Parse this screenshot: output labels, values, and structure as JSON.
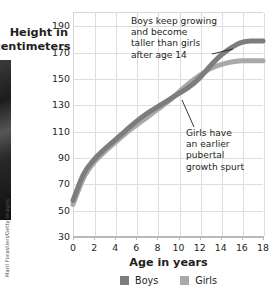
{
  "figure": {
    "photo_credit": "Maril Forastieri/Getty Images"
  },
  "legend": {
    "items": [
      {
        "label": "Boys",
        "color": "#7d7d7d"
      },
      {
        "label": "Girls",
        "color": "#a9a9a9"
      }
    ]
  },
  "annotations": {
    "boys": "Boys keep growing\nand become\ntaller than girls\nafter age 14",
    "girls": "Girls have\nan earlier\npubertal\ngrowth spurt"
  },
  "chart_data": {
    "type": "line",
    "title": "",
    "xlabel": "Age in years",
    "ylabel": "Height in centimeters",
    "xlim": [
      0,
      18
    ],
    "ylim": [
      30,
      200
    ],
    "xticks": [
      0,
      2,
      4,
      6,
      8,
      10,
      12,
      14,
      16,
      18
    ],
    "yticks": [
      30,
      50,
      70,
      90,
      110,
      130,
      150,
      170,
      190
    ],
    "xticklabels": [
      "0",
      "2",
      "4",
      "6",
      "8",
      "10",
      "12",
      "14",
      "16",
      "18"
    ],
    "yticklabels": [
      "30",
      "50",
      "70",
      "90",
      "110",
      "130",
      "150",
      "170",
      "190"
    ],
    "grid": true,
    "legend_position": "bottom-center",
    "x": [
      0,
      1,
      2,
      3,
      4,
      5,
      6,
      7,
      8,
      9,
      10,
      11,
      12,
      13,
      14,
      15,
      16,
      17,
      18
    ],
    "series": [
      {
        "name": "Boys",
        "color": "#7d7d7d",
        "values": [
          57,
          77,
          88,
          96,
          103,
          110,
          117,
          123,
          128,
          133,
          138,
          143,
          150,
          159,
          167,
          173,
          177,
          178,
          178
        ]
      },
      {
        "name": "Girls",
        "color": "#a9a9a9",
        "values": [
          54,
          74,
          86,
          94,
          101,
          108,
          114,
          120,
          126,
          132,
          139,
          146,
          152,
          157,
          160,
          162,
          163,
          163,
          163
        ]
      }
    ],
    "annotations": [
      {
        "name": "boys-annotation",
        "text": "Boys keep growing and become taller than girls after age 14",
        "points_to_series": "Boys",
        "points_to_x": 15.5
      },
      {
        "name": "girls-annotation",
        "text": "Girls have an earlier pubertal growth spurt",
        "points_to_series": "Girls",
        "points_to_x": 11
      }
    ]
  }
}
